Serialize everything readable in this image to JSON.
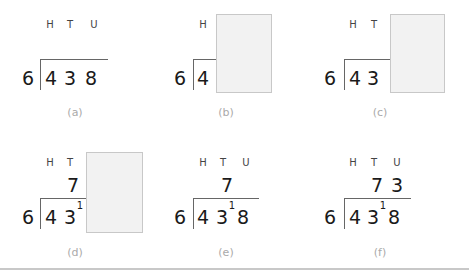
{
  "place_values": {
    "h": "H",
    "t": "T",
    "u": "U"
  },
  "divisor": "6",
  "dividend_digits": [
    "4",
    "3",
    "8"
  ],
  "carry": "1",
  "panels": [
    {
      "caption": "(a)",
      "headers": [
        "H",
        "T",
        "U"
      ],
      "quotient": [],
      "dividend": [
        "4",
        "3",
        "8"
      ],
      "carry": null,
      "covered": false
    },
    {
      "caption": "(b)",
      "headers": [
        "H"
      ],
      "quotient": [],
      "dividend": [
        "4"
      ],
      "carry": null,
      "covered": true
    },
    {
      "caption": "(c)",
      "headers": [
        "H",
        "T"
      ],
      "quotient": [],
      "dividend": [
        "4",
        "3"
      ],
      "carry": null,
      "covered": true
    },
    {
      "caption": "(d)",
      "headers": [
        "H",
        "T"
      ],
      "quotient": [
        "7"
      ],
      "dividend": [
        "4",
        "3"
      ],
      "carry": "1",
      "covered": true
    },
    {
      "caption": "(e)",
      "headers": [
        "H",
        "T",
        "U"
      ],
      "quotient": [
        "7"
      ],
      "dividend": [
        "4",
        "3",
        "8"
      ],
      "carry": "1",
      "covered": false
    },
    {
      "caption": "(f)",
      "headers": [
        "H",
        "T",
        "U"
      ],
      "quotient": [
        "7",
        "3"
      ],
      "dividend": [
        "4",
        "3",
        "8"
      ],
      "carry": "1",
      "covered": false
    }
  ],
  "colors": {
    "digit": "#1a1a1a",
    "header": "#444444",
    "caption": "#aaaaaa",
    "cover_fill": "#f2f2f2",
    "cover_border": "#c8c8c8",
    "rule": "#666666"
  }
}
